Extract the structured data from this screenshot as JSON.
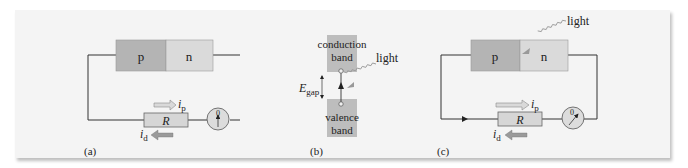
{
  "figure": {
    "panels": [
      {
        "label": "(a)",
        "junction": {
          "p_label": "p",
          "n_label": "n"
        },
        "resistor_label": "R",
        "meter_label": "0",
        "current_p": {
          "symbol": "i",
          "sub": "p"
        },
        "current_d": {
          "symbol": "i",
          "sub": "d"
        }
      },
      {
        "label": "(b)",
        "conduction_band": [
          "conduction",
          "band"
        ],
        "valence_band": [
          "valence",
          "band"
        ],
        "gap": {
          "symbol": "E",
          "sub": "gap"
        },
        "light_label": "light"
      },
      {
        "label": "(c)",
        "junction": {
          "p_label": "p",
          "n_label": "n"
        },
        "resistor_label": "R",
        "meter_label": "0",
        "light_label": "light",
        "current_p": {
          "symbol": "i",
          "sub": "p"
        },
        "current_d": {
          "symbol": "i",
          "sub": "d"
        }
      }
    ],
    "colors": {
      "p_region": "#b4b4b4",
      "n_region": "#dadada",
      "band": "#bdbdbd",
      "resistor": "#d6d6d6",
      "wire": "#333333",
      "arrow": "#9a9a9a",
      "panel_bg": "#f4f4f4"
    }
  }
}
